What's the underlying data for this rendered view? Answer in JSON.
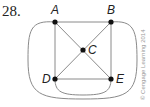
{
  "problem_number": "28.",
  "credit": "© Cengage Learning 2014",
  "graph": {
    "vertices": [
      {
        "id": "A",
        "label": "A",
        "x": 55,
        "y": 22
      },
      {
        "id": "B",
        "label": "B",
        "x": 111,
        "y": 22
      },
      {
        "id": "C",
        "label": "C",
        "x": 83,
        "y": 50
      },
      {
        "id": "D",
        "label": "D",
        "x": 55,
        "y": 79
      },
      {
        "id": "E",
        "label": "E",
        "x": 111,
        "y": 79
      }
    ],
    "edges": [
      [
        "A",
        "B"
      ],
      [
        "A",
        "D"
      ],
      [
        "B",
        "E"
      ],
      [
        "D",
        "E"
      ],
      [
        "A",
        "C"
      ],
      [
        "C",
        "E"
      ],
      [
        "B",
        "C"
      ],
      [
        "C",
        "D"
      ],
      [
        "A",
        "B",
        "outer-curve"
      ],
      [
        "D",
        "E",
        "lower-curve"
      ]
    ],
    "colors": {
      "edge": "#8a8a8a",
      "vertex": "#111111"
    }
  }
}
